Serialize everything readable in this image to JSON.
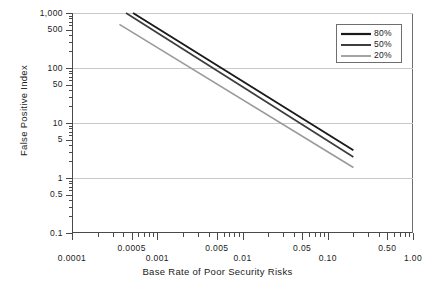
{
  "chart_data": {
    "type": "line",
    "title": "",
    "xlabel": "Base Rate of Poor Security Risks",
    "ylabel": "False Positive Index",
    "xscale": "log",
    "yscale": "log",
    "xlim": [
      0.0001,
      1.0
    ],
    "ylim": [
      0.1,
      1000
    ],
    "grid": true,
    "grid_y_values": [
      1000,
      100,
      10,
      1
    ],
    "legend_position": "top-right",
    "x_tick_labels_upper": [
      "0.0005",
      "0.005",
      "0.05",
      "0.50"
    ],
    "x_tick_values_upper": [
      0.0005,
      0.005,
      0.05,
      0.5
    ],
    "x_tick_labels_lower": [
      "0.0001",
      "0.001",
      "0.01",
      "0.10",
      "1.00"
    ],
    "x_tick_values_lower": [
      0.0001,
      0.001,
      0.01,
      0.1,
      1.0
    ],
    "y_tick_labels": [
      "1,000",
      "500",
      "100",
      "50",
      "10",
      "5",
      "1",
      "0.5",
      "0.1"
    ],
    "y_tick_values": [
      1000,
      500,
      100,
      50,
      10,
      5,
      1,
      0.5,
      0.1
    ],
    "series": [
      {
        "name": "80%",
        "color": "#1a1a1a",
        "width": 1.9,
        "x": [
          0.00052,
          0.2
        ],
        "y": [
          1000,
          3.2
        ]
      },
      {
        "name": "50%",
        "color": "#3d3d3d",
        "width": 1.7,
        "x": [
          0.00043,
          0.2
        ],
        "y": [
          1000,
          2.4
        ]
      },
      {
        "name": "20%",
        "color": "#9a9a9a",
        "width": 1.6,
        "x": [
          0.00036,
          0.2
        ],
        "y": [
          620,
          1.55
        ]
      }
    ]
  },
  "legend": {
    "items": [
      {
        "label": "80%"
      },
      {
        "label": "50%"
      },
      {
        "label": "20%"
      }
    ]
  },
  "axes": {
    "x_title": "Base Rate of Poor Security Risks",
    "y_title": "False Positive Index"
  }
}
